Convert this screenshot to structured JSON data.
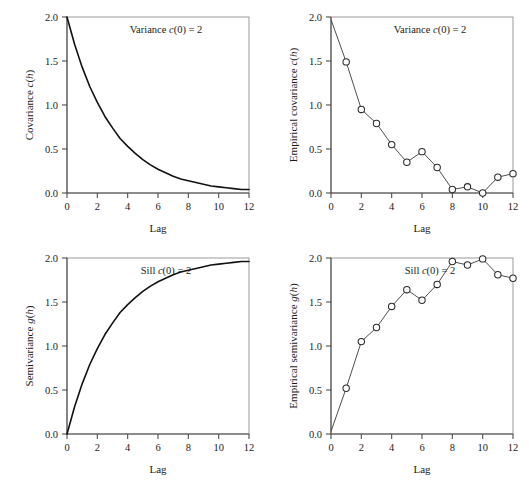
{
  "figure": {
    "panel_count": 4,
    "background": "#ffffff",
    "frame_color": "#999999",
    "curve_color": "#111111",
    "marker_fill": "#ffffff",
    "marker_stroke": "#2b2b2b"
  },
  "shared": {
    "xlabel": "Lag",
    "xticks": [
      "0",
      "2",
      "4",
      "6",
      "8",
      "10",
      "12"
    ],
    "xtick_values": [
      0,
      2,
      4,
      6,
      8,
      10,
      12
    ],
    "yticks": [
      "0.0",
      "0.5",
      "1.0",
      "1.5",
      "2.0"
    ],
    "ytick_values": [
      0.0,
      0.5,
      1.0,
      1.5,
      2.0
    ],
    "xlim": [
      0,
      12
    ],
    "ylim": [
      0,
      2
    ]
  },
  "chart_data": [
    {
      "id": "covariance-model",
      "position": "top-left",
      "type": "line",
      "title": "",
      "annotation": "Variance c(0) = 2",
      "annotation_parts": {
        "prefix": "Variance ",
        "italic": "c",
        "suffix": "(0) = 2"
      },
      "xlabel": "Lag",
      "ylabel": "Covariance c(h)",
      "ylabel_parts": {
        "prefix": "Covariance ",
        "italic1": "c",
        "mid": "(",
        "italic2": "h",
        "suffix": ")"
      },
      "xlim": [
        0,
        12
      ],
      "ylim": [
        0,
        2
      ],
      "grid": false,
      "legend": "none",
      "model": "exponential",
      "formula": "c(h) = 2 * exp(-h/3)",
      "x": [
        0,
        0.5,
        1,
        1.5,
        2,
        2.5,
        3,
        3.5,
        4,
        4.5,
        5,
        5.5,
        6,
        6.5,
        7,
        7.5,
        8,
        8.5,
        9,
        9.5,
        10,
        10.5,
        11,
        11.5,
        12
      ],
      "y": [
        2.0,
        1.69,
        1.43,
        1.21,
        1.03,
        0.87,
        0.74,
        0.62,
        0.53,
        0.45,
        0.38,
        0.32,
        0.27,
        0.23,
        0.19,
        0.16,
        0.14,
        0.12,
        0.1,
        0.08,
        0.07,
        0.06,
        0.05,
        0.04,
        0.04
      ]
    },
    {
      "id": "empirical-covariance",
      "position": "top-right",
      "type": "scatter",
      "title": "",
      "annotation": "Variance c(0) = 2",
      "annotation_parts": {
        "prefix": "Variance ",
        "italic": "c",
        "suffix": "(0) = 2"
      },
      "xlabel": "Lag",
      "ylabel": "Empirical covariance c(h)",
      "ylabel_parts": {
        "prefix": "Empirical covariance ",
        "italic1": "c",
        "mid": "(",
        "italic2": "h",
        "suffix": ")"
      },
      "xlim": [
        0,
        12
      ],
      "ylim": [
        0,
        2
      ],
      "grid": false,
      "legend": "none",
      "marker": "open-circle",
      "connected": true,
      "x": [
        0,
        1,
        2,
        3,
        4,
        5,
        6,
        7,
        8,
        9,
        10,
        11,
        12
      ],
      "y": [
        1.97,
        1.49,
        0.95,
        0.79,
        0.55,
        0.35,
        0.47,
        0.29,
        0.04,
        0.07,
        0.0,
        0.18,
        0.22
      ],
      "first_point_marker": false
    },
    {
      "id": "semivariance-model",
      "position": "bottom-left",
      "type": "line",
      "title": "",
      "annotation": "Sill c(0) = 2",
      "annotation_parts": {
        "prefix": "Sill ",
        "italic": "c",
        "suffix": "(0) = 2"
      },
      "xlabel": "Lag",
      "ylabel": "Semivariance g(h)",
      "ylabel_parts": {
        "prefix": "Semivariance ",
        "italic1": "g",
        "mid": "(",
        "italic2": "h",
        "suffix": ")"
      },
      "xlim": [
        0,
        12
      ],
      "ylim": [
        0,
        2
      ],
      "grid": false,
      "legend": "none",
      "model": "exponential",
      "formula": "g(h) = 2 * (1 - exp(-h/3))",
      "x": [
        0,
        0.5,
        1,
        1.5,
        2,
        2.5,
        3,
        3.5,
        4,
        4.5,
        5,
        5.5,
        6,
        6.5,
        7,
        7.5,
        8,
        8.5,
        9,
        9.5,
        10,
        10.5,
        11,
        11.5,
        12
      ],
      "y": [
        0.0,
        0.31,
        0.57,
        0.79,
        0.97,
        1.13,
        1.26,
        1.38,
        1.47,
        1.55,
        1.62,
        1.68,
        1.73,
        1.77,
        1.81,
        1.84,
        1.86,
        1.88,
        1.9,
        1.92,
        1.93,
        1.94,
        1.95,
        1.96,
        1.96
      ]
    },
    {
      "id": "empirical-semivariance",
      "position": "bottom-right",
      "type": "scatter",
      "title": "",
      "annotation": "Sill c(0) = 2",
      "annotation_parts": {
        "prefix": "Sill ",
        "italic": "c",
        "suffix": "(0) = 2"
      },
      "xlabel": "Lag",
      "ylabel": "Empirical semivariance g(h)",
      "ylabel_parts": {
        "prefix": "Empirical semivariance ",
        "italic1": "g",
        "mid": "(",
        "italic2": "h",
        "suffix": ")"
      },
      "xlim": [
        0,
        12
      ],
      "ylim": [
        0,
        2
      ],
      "grid": false,
      "legend": "none",
      "marker": "open-circle",
      "connected": true,
      "x": [
        0,
        1,
        2,
        3,
        4,
        5,
        6,
        7,
        8,
        9,
        10,
        11,
        12
      ],
      "y": [
        0.03,
        0.52,
        1.05,
        1.21,
        1.45,
        1.64,
        1.52,
        1.7,
        1.96,
        1.92,
        1.99,
        1.81,
        1.77
      ],
      "first_point_marker": false
    }
  ]
}
